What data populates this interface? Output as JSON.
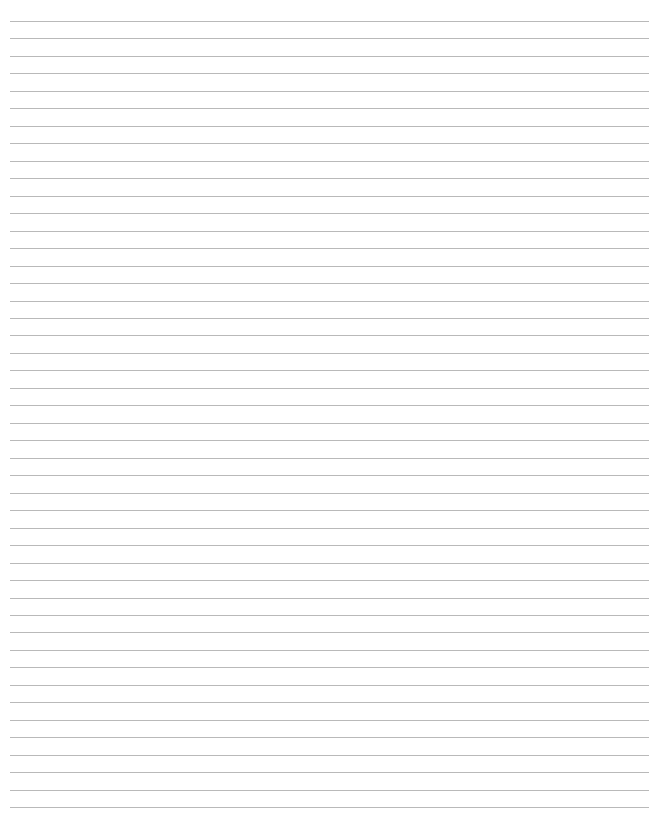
{
  "page": {
    "type": "lined-paper",
    "background_color": "#ffffff",
    "line_color": "#b9b9b9",
    "line_count": 46,
    "first_line_y": 21,
    "line_spacing": 17.47,
    "line_left_x": 10,
    "line_right_x": 649
  }
}
